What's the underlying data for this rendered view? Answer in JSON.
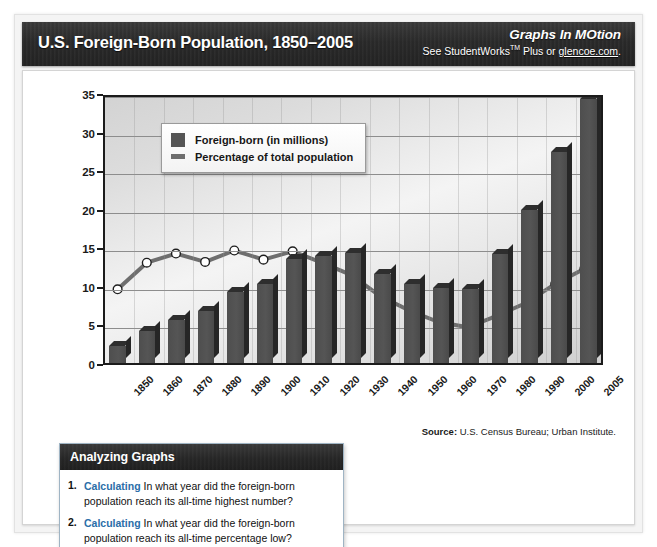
{
  "header": {
    "title": "U.S. Foreign-Born Population, 1850–2005",
    "brand_logo": "Graphs In MOtion",
    "brand_sub_prefix": "See StudentWorks",
    "brand_tm": "TM",
    "brand_sub_mid": " Plus or ",
    "brand_link": "glencoe.com",
    "brand_sub_end": "."
  },
  "source": {
    "label": "Source:",
    "text": " U.S. Census Bureau; Urban Institute."
  },
  "legend": {
    "bar_label": "Foreign-born (in millions)",
    "line_label": "Percentage of total population"
  },
  "analyzing": {
    "heading": "Analyzing Graphs",
    "questions": [
      {
        "num": "1.",
        "verb": "Calculating",
        "text": "In what year did the foreign-born population reach its all-time highest number?"
      },
      {
        "num": "2.",
        "verb": "Calculating",
        "text": "In what year did the foreign-born population reach its all-time percentage low?"
      }
    ]
  },
  "chart_data": {
    "type": "bar",
    "title": "U.S. Foreign-Born Population, 1850–2005",
    "xlabel": "",
    "ylabel": "",
    "ylim": [
      0,
      35
    ],
    "yticks": [
      0,
      5,
      10,
      15,
      20,
      25,
      30,
      35
    ],
    "grid": true,
    "legend_position": "top-left-inside",
    "categories": [
      "1850",
      "1860",
      "1870",
      "1880",
      "1890",
      "1900",
      "1910",
      "1920",
      "1930",
      "1940",
      "1950",
      "1960",
      "1970",
      "1980",
      "1990",
      "2000",
      "2005"
    ],
    "series": [
      {
        "name": "Foreign-born (in millions)",
        "type": "bar",
        "color": "#4e4e4e",
        "values": [
          2.2,
          4.1,
          5.6,
          6.7,
          9.2,
          10.3,
          13.5,
          13.9,
          14.2,
          11.6,
          10.3,
          9.7,
          9.6,
          14.1,
          19.8,
          27.3,
          34.2
        ]
      },
      {
        "name": "Percentage of total population",
        "type": "line",
        "color": "#6e6e6e",
        "marker": "white-circle",
        "values": [
          9.7,
          13.2,
          14.4,
          13.3,
          14.8,
          13.6,
          14.7,
          13.2,
          11.6,
          8.8,
          6.9,
          5.4,
          4.7,
          6.2,
          7.9,
          10.4,
          12.4
        ]
      }
    ]
  }
}
